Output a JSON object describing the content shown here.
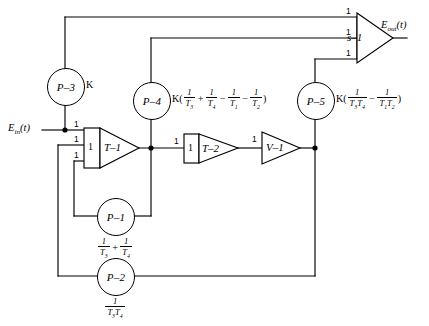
{
  "diagram": {
    "stroke_color": "#000000",
    "background": "#ffffff",
    "signals": {
      "input": "E",
      "input_sub": "in",
      "input_arg": "(t)",
      "output": "E",
      "output_sub": "out",
      "output_arg": "(t)"
    },
    "potentiometers": [
      {
        "id": "P-1",
        "name": "P–1",
        "label_parts": [
          {
            "type": "frac",
            "num": "1",
            "den": "T",
            "den_sub": "3"
          },
          {
            "type": "op",
            "text": "+"
          },
          {
            "type": "frac",
            "num": "1",
            "den": "T",
            "den_sub": "4"
          }
        ],
        "label_plain": "1/T3 + 1/T4"
      },
      {
        "id": "P-2",
        "name": "P–2",
        "label_parts": [
          {
            "type": "frac",
            "num": "1",
            "den": "T T",
            "den_sub": "3 4"
          }
        ],
        "label_plain": "1/(T3 T4)"
      },
      {
        "id": "P-3",
        "name": "P–3",
        "label_parts": [
          {
            "type": "text",
            "text": "K"
          }
        ],
        "label_plain": "K"
      },
      {
        "id": "P-4",
        "name": "P–4",
        "label_parts": [
          {
            "type": "text",
            "text": "K("
          },
          {
            "type": "frac",
            "num": "1",
            "den": "T",
            "den_sub": "3"
          },
          {
            "type": "op",
            "text": "+"
          },
          {
            "type": "frac",
            "num": "1",
            "den": "T",
            "den_sub": "4"
          },
          {
            "type": "op",
            "text": "−"
          },
          {
            "type": "frac",
            "num": "1",
            "den": "T",
            "den_sub": "1"
          },
          {
            "type": "op",
            "text": "−"
          },
          {
            "type": "frac",
            "num": "1",
            "den": "T",
            "den_sub": "2"
          },
          {
            "type": "text",
            "text": ")"
          }
        ],
        "label_plain": "K(1/T3 + 1/T4 - 1/T1 - 1/T2)"
      },
      {
        "id": "P-5",
        "name": "P–5",
        "label_parts": [
          {
            "type": "text",
            "text": "K("
          },
          {
            "type": "frac",
            "num": "1",
            "den": "T T",
            "den_sub": "3 4"
          },
          {
            "type": "op",
            "text": "−"
          },
          {
            "type": "frac",
            "num": "1",
            "den": "T T",
            "den_sub": "1 2"
          },
          {
            "type": "text",
            "text": ")"
          }
        ],
        "label_plain": "K(1/(T3 T4) - 1/(T1 T2))"
      }
    ],
    "amplifiers": [
      {
        "id": "T-1",
        "name": "T–1",
        "inputs": [
          "1",
          "1",
          "1"
        ],
        "has_input_box": true
      },
      {
        "id": "T-2",
        "name": "T–2",
        "inputs": [
          "1"
        ],
        "has_input_box": true
      },
      {
        "id": "V-1",
        "name": "V–1",
        "inputs": [
          "1"
        ],
        "has_input_box": false
      },
      {
        "id": "S-1",
        "name": "s–1",
        "inputs": [
          "1",
          "1",
          "1"
        ],
        "has_input_box": false
      }
    ]
  }
}
